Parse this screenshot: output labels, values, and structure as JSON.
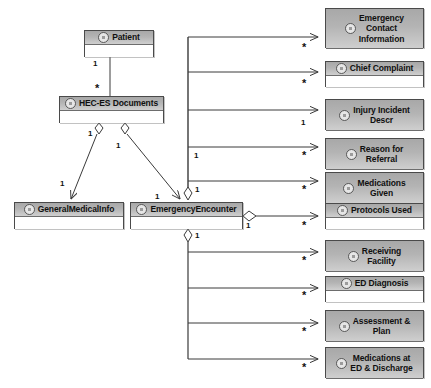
{
  "diagram": {
    "type": "uml-class-diagram",
    "background_color": "#ffffff",
    "class_header_color": "#b4b4b4",
    "class_body_color": "#ffffff",
    "line_color": "#3a3a3a"
  },
  "classes": [
    {
      "id": "patient",
      "name": "Patient",
      "icon": "uml-class-icon",
      "x": 84,
      "y": 30,
      "w": 70,
      "h": 27,
      "header_h": 14
    },
    {
      "id": "hec_es_docs",
      "name": "HEC-ES Documents",
      "icon": "uml-class-icon",
      "x": 59,
      "y": 96,
      "w": 105,
      "h": 27,
      "header_h": 14
    },
    {
      "id": "general_med",
      "name": "GeneralMedicalInfo",
      "icon": "uml-class-icon",
      "x": 14,
      "y": 202,
      "w": 110,
      "h": 27,
      "header_h": 14
    },
    {
      "id": "emerg_enc",
      "name": "EmergencyEncounter",
      "icon": "uml-class-icon",
      "x": 130,
      "y": 202,
      "w": 113,
      "h": 27,
      "header_h": 14
    },
    {
      "id": "emerg_contact",
      "name": "Emergency\nContact\nInformation",
      "icon": "uml-class-icon",
      "x": 325,
      "y": 8,
      "w": 99,
      "h": 40,
      "header_h": 40
    },
    {
      "id": "chief_compl",
      "name": "Chief Complaint",
      "icon": "uml-class-icon",
      "x": 325,
      "y": 61,
      "w": 99,
      "h": 26,
      "header_h": 14
    },
    {
      "id": "injury_desc",
      "name": "Injury Incident\nDescr",
      "icon": "uml-class-icon",
      "x": 325,
      "y": 99,
      "w": 99,
      "h": 31,
      "header_h": 31
    },
    {
      "id": "reason_ref",
      "name": "Reason for\nReferral",
      "icon": "uml-class-icon",
      "x": 325,
      "y": 138,
      "w": 99,
      "h": 31,
      "header_h": 31
    },
    {
      "id": "meds_given",
      "name": "Medications\nGiven",
      "icon": "uml-class-icon",
      "x": 325,
      "y": 172,
      "w": 99,
      "h": 31,
      "header_h": 31
    },
    {
      "id": "protocols",
      "name": "Protocols Used",
      "icon": "uml-class-icon",
      "x": 325,
      "y": 203,
      "w": 99,
      "h": 26,
      "header_h": 14
    },
    {
      "id": "recv_fac",
      "name": "Receiving\nFacility",
      "icon": "uml-class-icon",
      "x": 325,
      "y": 240,
      "w": 99,
      "h": 31,
      "header_h": 31
    },
    {
      "id": "ed_diag",
      "name": "ED Diagnosis",
      "icon": "uml-class-icon",
      "x": 325,
      "y": 276,
      "w": 99,
      "h": 26,
      "header_h": 14
    },
    {
      "id": "assess_plan",
      "name": "Assessment &\nPlan",
      "icon": "uml-class-icon",
      "x": 325,
      "y": 310,
      "w": 99,
      "h": 31,
      "header_h": 31
    },
    {
      "id": "meds_ed",
      "name": "Medications at\nED & Discharge",
      "icon": "uml-class-icon",
      "x": 325,
      "y": 347,
      "w": 99,
      "h": 31,
      "header_h": 31
    }
  ],
  "multiplicity_labels": [
    {
      "id": "m_patient_1",
      "text": "1",
      "x": 93,
      "y": 60
    },
    {
      "id": "m_hecdoc_star",
      "text": "*",
      "x": 95,
      "y": 85
    },
    {
      "id": "m_dia_left_1",
      "text": "1",
      "x": 88,
      "y": 130
    },
    {
      "id": "m_dia_right_1",
      "text": "1",
      "x": 116,
      "y": 142
    },
    {
      "id": "m_genmed_1",
      "text": "1",
      "x": 60,
      "y": 180
    },
    {
      "id": "m_emerg_1",
      "text": "1",
      "x": 155,
      "y": 193
    },
    {
      "id": "m_trunk_top_1",
      "text": "1",
      "x": 194,
      "y": 152
    },
    {
      "id": "m_enc_top_1",
      "text": "1",
      "x": 195,
      "y": 186
    },
    {
      "id": "m_enc_right_1",
      "text": "1",
      "x": 246,
      "y": 222
    },
    {
      "id": "m_enc_bottom_1",
      "text": "1",
      "x": 195,
      "y": 232
    },
    {
      "id": "m_arrow_contact",
      "text": "*",
      "x": 302,
      "y": 44
    },
    {
      "id": "m_arrow_chief",
      "text": "*",
      "x": 302,
      "y": 80
    },
    {
      "id": "m_arrow_injury",
      "text": "1",
      "x": 301,
      "y": 119
    },
    {
      "id": "m_arrow_reason",
      "text": "*",
      "x": 302,
      "y": 152
    },
    {
      "id": "m_arrow_meds",
      "text": "*",
      "x": 302,
      "y": 186
    },
    {
      "id": "m_arrow_proto",
      "text": "*",
      "x": 302,
      "y": 222
    },
    {
      "id": "m_arrow_recv",
      "text": "*",
      "x": 302,
      "y": 257
    },
    {
      "id": "m_arrow_eddiag",
      "text": "*",
      "x": 302,
      "y": 292
    },
    {
      "id": "m_arrow_assess",
      "text": "*",
      "x": 302,
      "y": 328
    },
    {
      "id": "m_arrow_medsed",
      "text": "*",
      "x": 302,
      "y": 364
    }
  ],
  "relationships": [
    {
      "id": "rel_patient_hec",
      "from": "patient",
      "to": "hec_es_docs",
      "kind": "association",
      "from_mult": "1",
      "to_mult": "*"
    },
    {
      "id": "rel_hec_genmed",
      "from": "hec_es_docs",
      "to": "general_med",
      "kind": "aggregation-arrow",
      "from_mult": "1",
      "to_mult": "1"
    },
    {
      "id": "rel_hec_emerg",
      "from": "hec_es_docs",
      "to": "emerg_enc",
      "kind": "aggregation-arrow",
      "from_mult": "1",
      "to_mult": "1"
    },
    {
      "id": "rel_enc_contact",
      "from": "emerg_enc",
      "to": "emerg_contact",
      "kind": "aggregation-arrow",
      "from_mult": "1",
      "to_mult": "*"
    },
    {
      "id": "rel_enc_chief",
      "from": "emerg_enc",
      "to": "chief_compl",
      "kind": "aggregation-arrow",
      "from_mult": "1",
      "to_mult": "*"
    },
    {
      "id": "rel_enc_injury",
      "from": "emerg_enc",
      "to": "injury_desc",
      "kind": "aggregation-arrow",
      "from_mult": "1",
      "to_mult": "1"
    },
    {
      "id": "rel_enc_reason",
      "from": "emerg_enc",
      "to": "reason_ref",
      "kind": "aggregation-arrow",
      "from_mult": "1",
      "to_mult": "*"
    },
    {
      "id": "rel_enc_meds",
      "from": "emerg_enc",
      "to": "meds_given",
      "kind": "aggregation-arrow",
      "from_mult": "1",
      "to_mult": "*"
    },
    {
      "id": "rel_enc_protocols",
      "from": "emerg_enc",
      "to": "protocols",
      "kind": "aggregation-arrow",
      "from_mult": "1",
      "to_mult": "*"
    },
    {
      "id": "rel_enc_recv",
      "from": "emerg_enc",
      "to": "recv_fac",
      "kind": "aggregation-arrow",
      "from_mult": "1",
      "to_mult": "*"
    },
    {
      "id": "rel_enc_eddiag",
      "from": "emerg_enc",
      "to": "ed_diag",
      "kind": "aggregation-arrow",
      "from_mult": "1",
      "to_mult": "*"
    },
    {
      "id": "rel_enc_assess",
      "from": "emerg_enc",
      "to": "assess_plan",
      "kind": "aggregation-arrow",
      "from_mult": "1",
      "to_mult": "*"
    },
    {
      "id": "rel_enc_medsed",
      "from": "emerg_enc",
      "to": "meds_ed",
      "kind": "aggregation-arrow",
      "from_mult": "1",
      "to_mult": "*"
    }
  ]
}
